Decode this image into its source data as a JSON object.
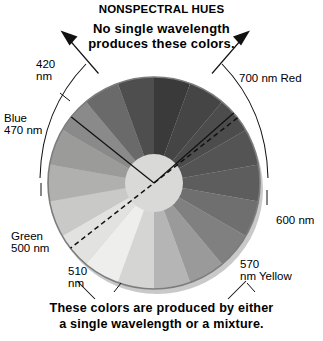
{
  "figure": {
    "title": "NONSPECTRAL HUES",
    "subtitle_line1": "No single wavelength",
    "subtitle_line2": "produces these colors.",
    "caption_line1": "These colors are produced by either",
    "caption_line2": "a single wavelength or a mixture."
  },
  "labels": {
    "blue": "Blue\n470 nm",
    "violet": "420\nnm",
    "red": "700 nm Red",
    "orange": "600 nm",
    "yellow": "570\nnm Yellow",
    "green": "Green\n500 nm",
    "cyan": "510\nnm"
  },
  "chart_data": {
    "type": "pie",
    "title": "NONSPECTRAL HUES",
    "legend": "none",
    "grid": false,
    "center_x": 154,
    "center_y": 183,
    "radius": 106,
    "hub_radius": 29,
    "hub_color": "#d9d9d7",
    "rim_color": "#6b6b6b",
    "wedge_count": 18,
    "wedge_span_deg": 20,
    "start_angle_deg": -90,
    "categories": [
      "violet-420",
      "violet-blue",
      "blue-470",
      "blue-cyan",
      "cyan-500",
      "green-510",
      "green",
      "green-yellow",
      "yellow-green",
      "yellow-570",
      "yellow-orange",
      "orange",
      "orange-600",
      "orange-red",
      "red",
      "red-700",
      "magenta",
      "purple"
    ],
    "values": [
      20,
      20,
      20,
      20,
      20,
      20,
      20,
      20,
      20,
      20,
      20,
      20,
      20,
      20,
      20,
      20,
      20,
      20
    ],
    "wedge_grays": [
      "#3a3a3a",
      "#454545",
      "#4c4c4c",
      "#545454",
      "#5d5d5d",
      "#6f6f6f",
      "#808080",
      "#9a9a9a",
      "#b5b5b5",
      "#d5d5d3",
      "#eeeeec",
      "#e2e2e0",
      "#c9c9c7",
      "#b0b0ae",
      "#9b9b99",
      "#8a8a8a",
      "#6a6a6a",
      "#4e4e4e"
    ],
    "markers": {
      "notch_label": "nonspectral-wedge",
      "notch_start_deg": -108,
      "notch_end_deg": -62,
      "dashed_axis_from_deg": -38,
      "dashed_axis_to_deg": 142
    },
    "wavelength_ticks_nm": [
      420,
      470,
      500,
      510,
      570,
      600,
      700
    ],
    "hue_names": [
      "Blue",
      "Green",
      "Yellow",
      "Red"
    ]
  },
  "colors": {
    "ink": "#000000",
    "background": "#ffffff",
    "rim": "#6b6b6b",
    "hub": "#d9d9d7"
  }
}
